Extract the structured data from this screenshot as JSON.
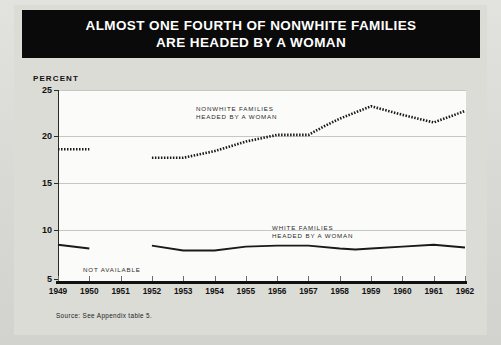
{
  "title": {
    "line1": "ALMOST ONE FOURTH OF NONWHITE FAMILIES",
    "line2": "ARE HEADED BY A WOMAN"
  },
  "axis": {
    "percent_label": "PERCENT"
  },
  "annotations": {
    "nonwhite_line1": "NONWHITE FAMILIES",
    "nonwhite_line2": "HEADED BY A WOMAN",
    "white_line1": "WHITE FAMILIES",
    "white_line2": "HEADED BY A WOMAN",
    "not_available": "NOT AVAILABLE"
  },
  "source": "Source: See Appendix table 5.",
  "colors": {
    "banner_background": "#0a0a0a",
    "banner_text": "#ffffff",
    "page_background": "#dcdcd7",
    "plot_background": "#fbfbfa",
    "gridline": "#c6c6c2",
    "series_line": "#1a1a1a"
  },
  "chart_data": {
    "type": "line",
    "title": "ALMOST ONE FOURTH OF NONWHITE FAMILIES ARE HEADED BY A WOMAN",
    "xlabel": "",
    "ylabel": "PERCENT",
    "x": [
      1949,
      1950,
      1951,
      1952,
      1953,
      1954,
      1955,
      1956,
      1957,
      1958,
      1959,
      1960,
      1961,
      1962
    ],
    "xtick_labels": [
      "1949",
      "1950",
      "1951",
      "1952",
      "1953",
      "1954",
      "1955",
      "1956",
      "1957",
      "1958",
      "1959",
      "1960",
      "1961",
      "1962"
    ],
    "ytick_labels": [
      "5",
      "10",
      "15",
      "20",
      "25"
    ],
    "yticks": [
      5,
      10,
      15,
      20,
      25
    ],
    "ylim": [
      5,
      25
    ],
    "xlim": [
      1949,
      1962
    ],
    "grid": true,
    "legend": "inline-annotations",
    "series": [
      {
        "name": "NONWHITE FAMILIES HEADED BY A WOMAN",
        "style": "dotted",
        "values": [
          18.8,
          18.8,
          null,
          17.9,
          17.9,
          18.6,
          19.6,
          20.3,
          20.3,
          21.2,
          22.0,
          23.3,
          22.4,
          21.6,
          22.8
        ],
        "x_values": [
          1949,
          1950,
          1951,
          1952,
          1953,
          1954,
          1955,
          1956,
          1957,
          1957.5,
          1958,
          1959,
          1960,
          1961,
          1962
        ],
        "gap_years": [
          1951
        ],
        "note": "Data not available for 1951"
      },
      {
        "name": "WHITE FAMILIES HEADED BY A WOMAN",
        "style": "solid",
        "values": [
          8.8,
          8.4,
          null,
          8.7,
          8.2,
          8.2,
          8.6,
          8.7,
          8.7,
          8.4,
          8.3,
          8.4,
          8.6,
          8.8,
          8.5
        ],
        "x_values": [
          1949,
          1950,
          1951,
          1952,
          1953,
          1954,
          1955,
          1956,
          1957,
          1958,
          1958.5,
          1959,
          1960,
          1961,
          1962
        ],
        "gap_years": [
          1951
        ],
        "note": "Data not available for 1951"
      }
    ]
  }
}
